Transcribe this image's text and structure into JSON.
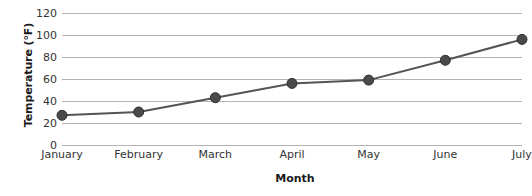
{
  "chart_data": {
    "type": "line",
    "title": "",
    "xlabel": "Month",
    "ylabel": "Temperature (°F)",
    "categories": [
      "January",
      "February",
      "March",
      "April",
      "May",
      "June",
      "July"
    ],
    "values": [
      27,
      30,
      43,
      56,
      59,
      77,
      96
    ],
    "series": [
      {
        "name": "Temperature",
        "values": [
          27,
          30,
          43,
          56,
          59,
          77,
          96
        ]
      }
    ],
    "ylim": [
      0,
      120
    ],
    "yticks": [
      0,
      20,
      40,
      60,
      80,
      100,
      120
    ],
    "ytick_labels": [
      "0",
      "20",
      "40",
      "60",
      "80",
      "100",
      "120"
    ],
    "grid": true,
    "grid_axis": "y",
    "legend": false,
    "legend_position": "none",
    "colors": {
      "line": "#545454",
      "marker": "#4a4a4a",
      "marker_edge": "#2e2e2e",
      "grid": "#b4b4b4",
      "text": "#333333",
      "title_text": "#1a1a1a",
      "background": "#ffffff"
    },
    "marker": "circle",
    "marker_size": 5,
    "line_width": 2
  }
}
